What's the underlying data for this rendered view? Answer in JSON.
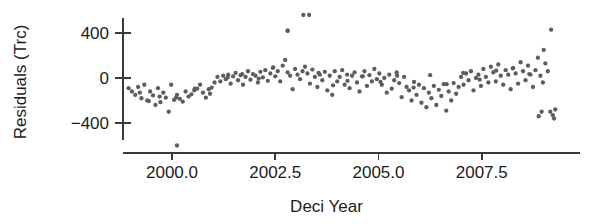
{
  "chart_data": {
    "type": "scatter",
    "title": "",
    "xlabel": "Deci Year",
    "ylabel": "Residuals (Trc)",
    "xlim": [
      1998.85,
      2009.55
    ],
    "ylim": [
      -700,
      620
    ],
    "xticks": [
      2000.0,
      2002.5,
      2005.0,
      2007.5
    ],
    "xticklabels": [
      "2000.0",
      "2002.5",
      "2005.0",
      "2007.5"
    ],
    "yticks": [
      400,
      0,
      -400
    ],
    "yticklabels": [
      "400",
      "0",
      "−400"
    ],
    "grid": false,
    "legend": null,
    "marker_color": "#5d5d5d",
    "marker_size": 3.6,
    "axis_color": "#3a3a3a",
    "background": "#ffffff",
    "n_points": 202,
    "x": [
      1998.95,
      1999.03,
      1999.11,
      1999.18,
      1999.26,
      1999.33,
      1999.4,
      1999.47,
      1999.54,
      1999.6,
      1999.66,
      1999.72,
      1999.79,
      1999.85,
      1999.92,
      1999.98,
      2000.05,
      2000.12,
      2000.19,
      2000.26,
      2000.33,
      2000.4,
      2000.47,
      2000.54,
      2000.61,
      2000.68,
      2000.75,
      2000.82,
      2000.89,
      2000.96,
      2001.03,
      2001.1,
      2001.17,
      2001.24,
      2001.3,
      2001.36,
      2001.42,
      2001.48,
      2001.54,
      2001.6,
      2001.66,
      2001.72,
      2001.78,
      2001.84,
      2001.9,
      2001.96,
      2002.02,
      2002.08,
      2002.14,
      2002.2,
      2002.26,
      2002.32,
      2002.38,
      2002.44,
      2002.5,
      2002.56,
      2002.62,
      2002.68,
      2002.74,
      2002.8,
      2002.86,
      2002.92,
      2002.98,
      2003.04,
      2003.1,
      2003.16,
      2003.22,
      2003.28,
      2003.34,
      2003.4,
      2003.46,
      2003.52,
      2003.58,
      2003.64,
      2003.7,
      2003.76,
      2003.82,
      2003.88,
      2003.94,
      2004.0,
      2004.06,
      2004.12,
      2004.18,
      2004.24,
      2004.3,
      2004.36,
      2004.42,
      2004.48,
      2004.54,
      2004.6,
      2004.66,
      2004.72,
      2004.78,
      2004.84,
      2004.9,
      2004.96,
      2005.02,
      2005.08,
      2005.14,
      2005.2,
      2005.26,
      2005.32,
      2005.38,
      2005.44,
      2005.5,
      2005.56,
      2005.62,
      2005.68,
      2005.74,
      2005.8,
      2005.86,
      2005.92,
      2005.98,
      2006.04,
      2006.1,
      2006.16,
      2006.22,
      2006.28,
      2006.34,
      2006.4,
      2006.46,
      2006.52,
      2006.58,
      2006.64,
      2006.7,
      2006.76,
      2006.82,
      2006.88,
      2006.94,
      2007.0,
      2007.06,
      2007.12,
      2007.18,
      2007.24,
      2007.3,
      2007.36,
      2007.42,
      2007.48,
      2007.54,
      2007.6,
      2007.66,
      2007.72,
      2007.78,
      2007.84,
      2007.9,
      2007.96,
      2008.02,
      2008.08,
      2008.14,
      2008.2,
      2008.26,
      2008.32,
      2008.38,
      2008.44,
      2008.5,
      2008.56,
      2008.62,
      2008.68,
      2008.74,
      2008.8,
      2008.86,
      2008.92,
      2008.98,
      2009.04,
      2009.1,
      2009.16,
      2009.22,
      2009.28,
      1999.22,
      1999.44,
      1999.7,
      2000.1,
      2000.55,
      2000.92,
      2001.35,
      2001.7,
      2002.1,
      2002.45,
      2002.8,
      2003.18,
      2003.55,
      2003.9,
      2004.25,
      2004.62,
      2005.05,
      2005.45,
      2005.85,
      2006.25,
      2006.65,
      2007.05,
      2007.45,
      2007.85,
      2008.25,
      2008.65,
      2009.0,
      2009.18,
      2000.12,
      2003.32,
      2002.8,
      2008.88,
      2008.95,
      2009.25
    ],
    "y": [
      -90,
      -120,
      -150,
      -80,
      -180,
      -60,
      -200,
      -120,
      -155,
      -240,
      -90,
      -215,
      -130,
      -175,
      -300,
      -60,
      -195,
      -150,
      -185,
      -210,
      -120,
      -165,
      -145,
      -110,
      -95,
      -60,
      -130,
      -175,
      -100,
      -85,
      -40,
      10,
      -30,
      20,
      -10,
      30,
      -50,
      15,
      45,
      -20,
      25,
      -60,
      10,
      60,
      -15,
      35,
      20,
      -40,
      55,
      5,
      70,
      -25,
      40,
      90,
      15,
      60,
      -30,
      110,
      160,
      50,
      20,
      -100,
      80,
      30,
      -10,
      60,
      100,
      40,
      -50,
      75,
      10,
      -80,
      30,
      -20,
      55,
      -110,
      20,
      -150,
      60,
      -30,
      10,
      70,
      -60,
      30,
      -90,
      20,
      50,
      -40,
      -120,
      15,
      60,
      -70,
      25,
      -30,
      80,
      -10,
      40,
      -60,
      0,
      -130,
      30,
      -95,
      -20,
      50,
      -45,
      -170,
      10,
      -80,
      -110,
      -200,
      -35,
      -150,
      -60,
      -220,
      -90,
      -260,
      -130,
      -180,
      -70,
      -240,
      -105,
      -160,
      -55,
      -290,
      -120,
      -200,
      -45,
      -140,
      -80,
      10,
      -60,
      40,
      -20,
      60,
      -110,
      0,
      30,
      -70,
      80,
      10,
      -40,
      100,
      50,
      -30,
      120,
      20,
      -60,
      70,
      30,
      -100,
      90,
      40,
      -50,
      140,
      60,
      -20,
      110,
      30,
      -80,
      70,
      180,
      20,
      -40,
      130,
      60,
      -300,
      -330,
      -280,
      -130,
      -205,
      -165,
      -175,
      -95,
      -140,
      5,
      35,
      -5,
      95,
      420,
      560,
      45,
      -65,
      -25,
      15,
      -35,
      20,
      -85,
      25,
      -55,
      45,
      -15,
      65,
      85,
      35,
      250,
      430,
      -600,
      560,
      420,
      -340,
      -300,
      -360
    ]
  }
}
